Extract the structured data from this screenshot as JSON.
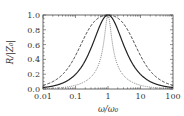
{
  "chart_data": {
    "type": "line",
    "title": "",
    "xlabel": "ω/ω₀",
    "ylabel": "R/|Z₀|",
    "xscale": "log",
    "xlim": [
      0.01,
      100
    ],
    "ylim": [
      0.0,
      1.0
    ],
    "x_ticks": [
      "0.01",
      "0.1",
      "1",
      "10",
      "100"
    ],
    "y_ticks": [
      "0.0",
      "0.2",
      "0.4",
      "0.6",
      "0.8",
      "1.0"
    ],
    "grid": false,
    "legend": "none",
    "x": [
      0.01,
      0.03,
      0.1,
      0.3,
      0.5,
      0.7,
      1,
      1.43,
      2,
      3.33,
      10,
      33.3,
      100
    ],
    "series": [
      {
        "name": "dashed (broad, Q≈0.2)",
        "style": "dashed",
        "Q": 0.2,
        "values": [
          0.45,
          0.16,
          0.45,
          0.83,
          0.93,
          0.97,
          1.0,
          0.97,
          0.93,
          0.83,
          0.45,
          0.15,
          0.05
        ]
      },
      {
        "name": "solid (medium, Q≈0.5)",
        "style": "solid",
        "Q": 0.5,
        "values": [
          0.02,
          0.07,
          0.2,
          0.57,
          0.8,
          0.94,
          1.0,
          0.94,
          0.8,
          0.57,
          0.2,
          0.06,
          0.02
        ]
      },
      {
        "name": "dotted (narrow, Q≈2)",
        "style": "dotted",
        "Q": 2,
        "values": [
          0.005,
          0.015,
          0.05,
          0.17,
          0.32,
          0.57,
          1.0,
          0.57,
          0.32,
          0.17,
          0.05,
          0.015,
          0.005
        ]
      }
    ]
  }
}
